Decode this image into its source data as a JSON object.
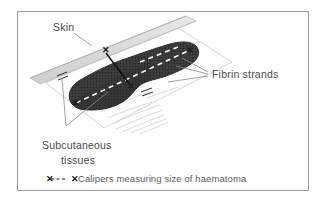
{
  "figure": {
    "type": "medical-illustration",
    "background_color": "#ffffff",
    "border_color": "#9a9a9a"
  },
  "labels": {
    "skin": "Skin",
    "fibrin_strands": "Fibrin strands",
    "subcutaneous_line1": "Subcutaneous",
    "subcutaneous_line2": "tissues"
  },
  "legend": {
    "marker_left": "✕",
    "marker_dashes": "- - -",
    "marker_right": "✕",
    "text": "Calipers measuring size of haematoma"
  },
  "colors": {
    "haematoma_fill": "#3a3a3a",
    "haematoma_stroke": "#2b2b2b",
    "skin_band": "#dcdcdc",
    "skin_band_edge": "#b5b5b5",
    "tissue_plane": "#c9c9c9",
    "fibrin_strand": "#cfcfcf",
    "caliper_line": "#111111",
    "caliper_dash_white": "#ffffff",
    "leader_line": "#8a8a8a",
    "text": "#4a4a4a",
    "legend_text": "#5a5a5a"
  }
}
